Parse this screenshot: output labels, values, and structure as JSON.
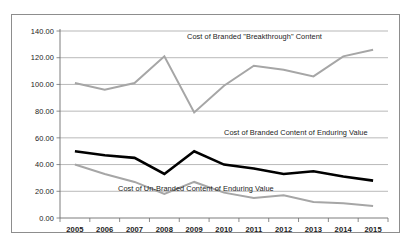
{
  "chart_data": {
    "type": "line",
    "title": "",
    "subtitle": "",
    "xlabel": "",
    "ylabel": "",
    "categories": [
      "2005",
      "2006",
      "2007",
      "2008",
      "2009",
      "2010",
      "2011",
      "2012",
      "2013",
      "2014",
      "2015"
    ],
    "ylim": [
      0,
      140
    ],
    "ytick_step": 20,
    "ytick_labels": [
      "0.00",
      "20.00",
      "40.00",
      "60.00",
      "80.00",
      "100.00",
      "120.00",
      "140.00"
    ],
    "ytick_values": [
      0,
      20,
      40,
      60,
      80,
      100,
      120,
      140
    ],
    "grid": true,
    "legend_position": "inline-annotations",
    "series": [
      {
        "name": "Cost of Branded \"Breakthrough\" Content",
        "color": "#a6a6a6",
        "width": 2.0,
        "values": [
          101,
          96,
          101,
          121,
          79,
          99,
          114,
          111,
          106,
          121,
          126
        ]
      },
      {
        "name": "Cost of Branded Content of Enduring Value",
        "color": "#000000",
        "width": 2.6,
        "values": [
          50,
          47,
          45,
          33,
          50,
          40,
          37,
          33,
          35,
          31,
          28
        ]
      },
      {
        "name": "Cost of Un-Branded Content of Enduring Value",
        "color": "#a6a6a6",
        "width": 2.0,
        "values": [
          40,
          33,
          27,
          18,
          27,
          19,
          15,
          17,
          12,
          11,
          9
        ]
      }
    ],
    "annotations": [
      {
        "text": "Cost of Branded \"Breakthrough\" Content",
        "x_px": 186,
        "y_px": 38
      },
      {
        "text": "Cost of Branded Content of Enduring Value",
        "x_px": 223,
        "y_px": 134
      },
      {
        "text": "Cost of Un-Branded Content of Enduring Value",
        "x_px": 117,
        "y_px": 190
      }
    ]
  },
  "colors": {
    "background": "#ffffff",
    "frame": "#8d8d8d",
    "gridline": "#9a9a9a",
    "axis": "#6e6e6e",
    "series_gray": "#a6a6a6",
    "series_black": "#000000",
    "text": "#1b1b1b"
  }
}
